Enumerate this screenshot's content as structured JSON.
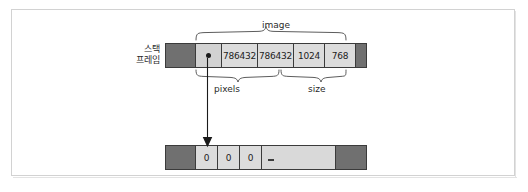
{
  "figure": {
    "colors": {
      "cell_fill": "#dcdcdc",
      "dark_fill": "#707070",
      "outline": "#3b3b3b",
      "border": "#d2d2d2",
      "text": "#1d1d1d"
    }
  },
  "stack": {
    "label_line1": "스택",
    "label_line2": "프레임",
    "cells": [
      {
        "text": "",
        "kind": "dark"
      },
      {
        "text": "",
        "kind": "pointer"
      },
      {
        "text": "786432",
        "kind": "value"
      },
      {
        "text": "786432",
        "kind": "value"
      },
      {
        "text": "1024",
        "kind": "value"
      },
      {
        "text": "768",
        "kind": "value"
      },
      {
        "text": "",
        "kind": "dark"
      }
    ]
  },
  "braces": {
    "image": "image",
    "pixels": "pixels",
    "size": "size"
  },
  "heap": {
    "cells": [
      {
        "text": "",
        "kind": "dark"
      },
      {
        "text": "0",
        "kind": "value"
      },
      {
        "text": "0",
        "kind": "value"
      },
      {
        "text": "0",
        "kind": "value"
      },
      {
        "text": "",
        "kind": "dash"
      },
      {
        "text": "",
        "kind": "dark"
      }
    ]
  }
}
